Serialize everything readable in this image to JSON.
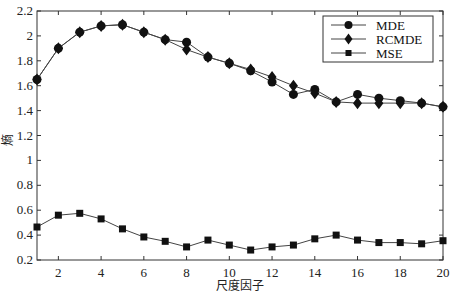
{
  "chart_data": {
    "type": "line",
    "title": "",
    "xlabel": "尺度因子",
    "ylabel": "熵",
    "x": [
      1,
      2,
      3,
      4,
      5,
      6,
      7,
      8,
      9,
      10,
      11,
      12,
      13,
      14,
      15,
      16,
      17,
      18,
      19,
      20
    ],
    "xlim": [
      1,
      20
    ],
    "ylim": [
      0.2,
      2.2
    ],
    "xticks": [
      2,
      4,
      6,
      8,
      10,
      12,
      14,
      16,
      18,
      20
    ],
    "yticks": [
      0.2,
      0.4,
      0.6,
      0.8,
      1,
      1.2,
      1.4,
      1.6,
      1.8,
      2,
      2.2
    ],
    "ytick_labels": [
      "0.2",
      "0.4",
      "0.6",
      "0.8",
      "1",
      "1.2",
      "1.4",
      "1.6",
      "1.8",
      "2",
      "2.2"
    ],
    "grid": false,
    "legend_position": "upper right",
    "series": [
      {
        "name": "MDE",
        "marker": "circle",
        "values": [
          1.65,
          1.9,
          2.03,
          2.08,
          2.09,
          2.03,
          1.97,
          1.95,
          1.83,
          1.78,
          1.72,
          1.63,
          1.53,
          1.57,
          1.47,
          1.53,
          1.5,
          1.48,
          1.46,
          1.43
        ]
      },
      {
        "name": "RCMDE",
        "marker": "diamond",
        "values": [
          1.65,
          1.9,
          2.03,
          2.08,
          2.09,
          2.03,
          1.97,
          1.89,
          1.83,
          1.78,
          1.73,
          1.67,
          1.6,
          1.54,
          1.47,
          1.46,
          1.46,
          1.46,
          1.46,
          1.43
        ]
      },
      {
        "name": "MSE",
        "marker": "square",
        "values": [
          0.465,
          0.56,
          0.575,
          0.53,
          0.45,
          0.385,
          0.35,
          0.305,
          0.36,
          0.32,
          0.28,
          0.305,
          0.32,
          0.37,
          0.4,
          0.36,
          0.34,
          0.34,
          0.33,
          0.355
        ]
      }
    ]
  },
  "legend": {
    "items": [
      {
        "label": "MDE"
      },
      {
        "label": "RCMDE"
      },
      {
        "label": "MSE"
      }
    ]
  },
  "axes": {
    "xlabel": "尺度因子",
    "ylabel": "熵"
  },
  "colors": {
    "line": "#444444",
    "marker": "#111111",
    "axis": "#333333"
  }
}
